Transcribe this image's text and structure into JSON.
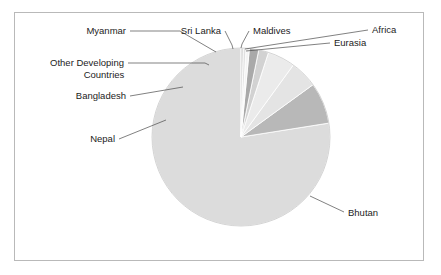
{
  "figure": {
    "background": "#ffffff",
    "frame_color": "#b9b9b9"
  },
  "chart_data": {
    "type": "pie",
    "title": "",
    "subtitle": "",
    "xlabel": "",
    "ylabel": "",
    "legend_position": "none",
    "labels_position": "outside-with-leader-lines",
    "grid": false,
    "start_angle_deg": 90,
    "direction": "counterclockwise",
    "categories": [
      "Bhutan",
      "Nepal",
      "Bangladesh",
      "Other Developing Countries",
      "Myanmar",
      "Sri Lanka",
      "Maldives",
      "Eurasia",
      "Africa"
    ],
    "values": [
      77.5,
      7.5,
      5.0,
      5.0,
      1.8,
      1.7,
      0.6,
      0.5,
      0.4
    ],
    "unit": "percent",
    "colors": [
      "#dcdcdc",
      "#b8b8b8",
      "#e4e4e4",
      "#ebebeb",
      "#d2d2d2",
      "#a9a9a9",
      "#f3f3f3",
      "#e0e0e0",
      "#cfcfcf"
    ],
    "slices": [
      {
        "name": "Bhutan",
        "value": 77.5,
        "color": "#dcdcdc",
        "label": "Bhutan"
      },
      {
        "name": "Nepal",
        "value": 7.5,
        "color": "#b8b8b8",
        "label": "Nepal"
      },
      {
        "name": "Bangladesh",
        "value": 5.0,
        "color": "#e4e4e4",
        "label": "Bangladesh"
      },
      {
        "name": "Other Developing Countries",
        "value": 5.0,
        "color": "#ebebeb",
        "label": "Other Developing"
      },
      {
        "name": "Myanmar",
        "value": 1.8,
        "color": "#d2d2d2",
        "label": "Myanmar"
      },
      {
        "name": "Sri Lanka",
        "value": 1.7,
        "color": "#a9a9a9",
        "label": "Sri Lanka"
      },
      {
        "name": "Maldives",
        "value": 0.6,
        "color": "#f3f3f3",
        "label": "Maldives"
      },
      {
        "name": "Eurasia",
        "value": 0.5,
        "color": "#e0e0e0",
        "label": "Eurasia"
      },
      {
        "name": "Africa",
        "value": 0.4,
        "color": "#cfcfcf",
        "label": "Africa"
      }
    ]
  },
  "labels": {
    "myanmar": "Myanmar",
    "sri_lanka": "Sri Lanka",
    "maldives": "Maldives",
    "africa": "Africa",
    "eurasia": "Eurasia",
    "other_developing_line1": "Other Developing",
    "other_developing_line2": "Countries",
    "bangladesh": "Bangladesh",
    "nepal": "Nepal",
    "bhutan": "Bhutan"
  }
}
